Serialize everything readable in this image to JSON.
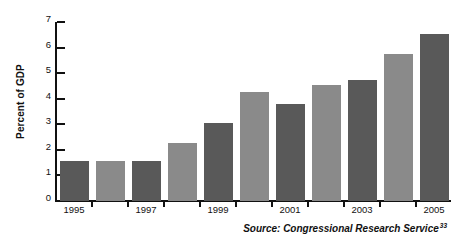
{
  "chart_data": {
    "type": "bar",
    "title": "",
    "subtitle": "",
    "xlabel": "",
    "ylabel": "Percent of GDP",
    "ylim": [
      0,
      7
    ],
    "ytick_step": 1,
    "yticks": [
      0,
      1,
      2,
      3,
      4,
      5,
      6,
      7
    ],
    "ytick_labels": [
      "0",
      "1",
      "2",
      "3",
      "4",
      "5",
      "6",
      "7"
    ],
    "grid": false,
    "legend": false,
    "legend_position": "none",
    "categories": [
      "1995",
      "1996",
      "1997",
      "1998",
      "1999",
      "2000",
      "2001",
      "2002",
      "2003",
      "2004",
      "2005"
    ],
    "xtick_labels": [
      "1995",
      "",
      "1997",
      "",
      "1999",
      "",
      "2001",
      "",
      "2003",
      "",
      "2005"
    ],
    "values": [
      1.55,
      1.55,
      1.55,
      2.25,
      3.05,
      4.25,
      3.8,
      4.55,
      4.75,
      5.75,
      6.55
    ],
    "bar_colors": [
      "#595959",
      "#8a8a8a",
      "#595959",
      "#8a8a8a",
      "#595959",
      "#8a8a8a",
      "#595959",
      "#8a8a8a",
      "#595959",
      "#8a8a8a",
      "#595959"
    ],
    "annotations": [
      {
        "name": "source-note",
        "text": "Source: Congressional Research Service",
        "superscript": "33"
      }
    ]
  },
  "colors": {
    "bar_dark": "#595959",
    "bar_light": "#8a8a8a",
    "axis": "#111111",
    "background": "#ffffff",
    "text": "#111111"
  }
}
